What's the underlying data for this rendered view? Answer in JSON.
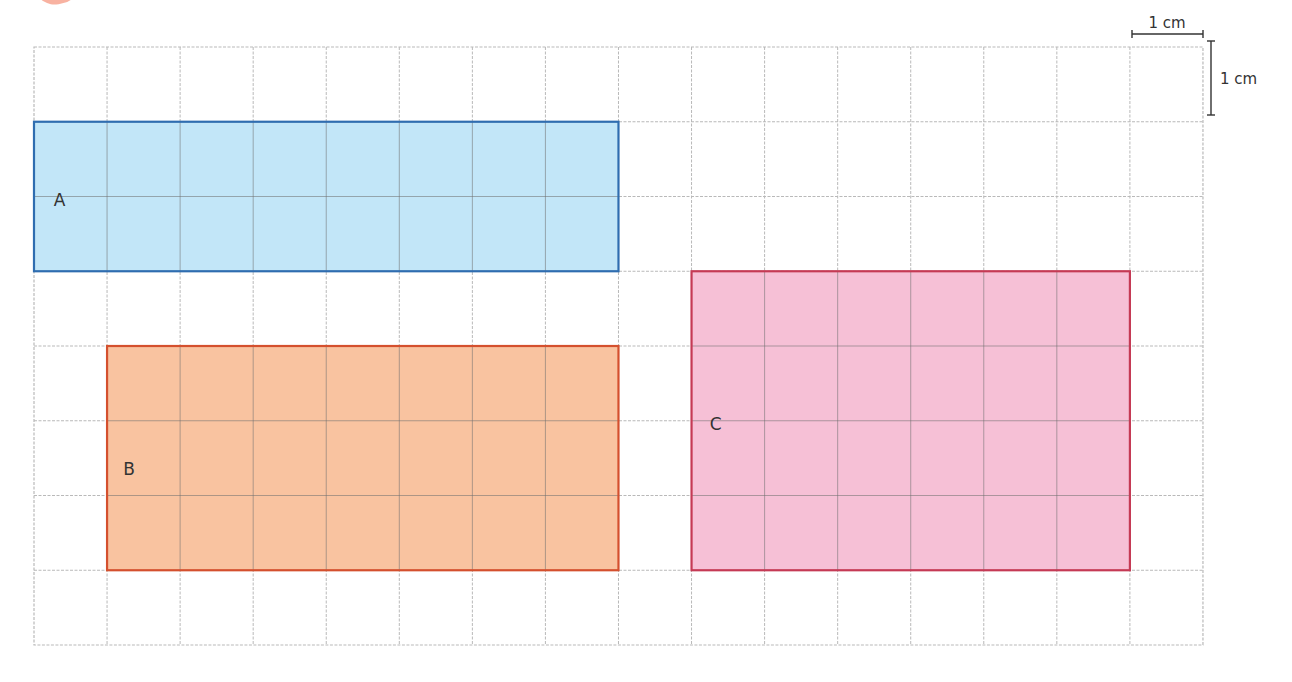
{
  "diagram": {
    "grid": {
      "left": 34,
      "top": 47,
      "cell_width": 73.06,
      "cell_height": 74.75,
      "columns": 16,
      "rows": 8
    },
    "scale": {
      "horizontal_label": "1 cm",
      "vertical_label": "1 cm"
    },
    "shapes": [
      {
        "label": "A",
        "col": 0,
        "row": 1,
        "width_cells": 8,
        "height_cells": 2,
        "fill": "#c2e6f8",
        "stroke": "#2f6db0",
        "label_dx": 0.35,
        "label_dy": 1.05
      },
      {
        "label": "B",
        "col": 1,
        "row": 4,
        "width_cells": 7,
        "height_cells": 3,
        "fill": "#f9c3a0",
        "stroke": "#d4502e",
        "label_dx": 0.3,
        "label_dy": 1.65
      },
      {
        "label": "C",
        "col": 9,
        "row": 3,
        "width_cells": 6,
        "height_cells": 4,
        "fill": "#f6c0d6",
        "stroke": "#c53a55",
        "label_dx": 0.33,
        "label_dy": 2.05
      }
    ]
  }
}
